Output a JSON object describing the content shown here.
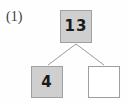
{
  "figure": {
    "label": "(1)",
    "type": "number-bond-tree",
    "background_color": "#fefefe",
    "filled_color": "#cfcfcf",
    "empty_color": "#ffffff",
    "border_color": "#a0a0a0",
    "line_color": "#9a9a9a",
    "text_color": "#1a1a1a"
  },
  "nodes": {
    "root": {
      "name": "total",
      "value": "13",
      "filled": "true"
    },
    "left": {
      "name": "part-left",
      "value": "4",
      "filled": "true"
    },
    "right": {
      "name": "part-right",
      "value": "",
      "filled": "false"
    }
  },
  "connectors": [
    {
      "from": "root",
      "to": "left"
    },
    {
      "from": "root",
      "to": "right"
    }
  ]
}
